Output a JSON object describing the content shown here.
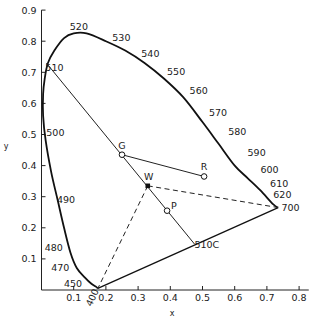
{
  "chart_data": {
    "type": "scatter",
    "title": "",
    "xlabel": "x",
    "ylabel": "y",
    "xlim": [
      0,
      0.83
    ],
    "ylim": [
      0,
      0.9
    ],
    "grid": false,
    "x_ticks": [
      "0.1",
      "0.2",
      "0.3",
      "0.4",
      "0.5",
      "0.6",
      "0.7",
      "0.8"
    ],
    "y_ticks": [
      "0.1",
      "0.2",
      "0.3",
      "0.4",
      "0.5",
      "0.6",
      "0.7",
      "0.8",
      "0.9"
    ],
    "spectral_locus": {
      "name": "Spectral locus",
      "points": [
        [
          0.175,
          0.005
        ],
        [
          0.17,
          0.01
        ],
        [
          0.155,
          0.02
        ],
        [
          0.135,
          0.04
        ],
        [
          0.11,
          0.07
        ],
        [
          0.09,
          0.12
        ],
        [
          0.07,
          0.2
        ],
        [
          0.05,
          0.29
        ],
        [
          0.03,
          0.38
        ],
        [
          0.013,
          0.48
        ],
        [
          0.005,
          0.56
        ],
        [
          0.005,
          0.63
        ],
        [
          0.01,
          0.68
        ],
        [
          0.02,
          0.73
        ],
        [
          0.04,
          0.77
        ],
        [
          0.07,
          0.81
        ],
        [
          0.1,
          0.825
        ],
        [
          0.14,
          0.825
        ],
        [
          0.2,
          0.8
        ],
        [
          0.26,
          0.77
        ],
        [
          0.32,
          0.73
        ],
        [
          0.38,
          0.68
        ],
        [
          0.44,
          0.62
        ],
        [
          0.5,
          0.54
        ],
        [
          0.55,
          0.47
        ],
        [
          0.6,
          0.4
        ],
        [
          0.64,
          0.36
        ],
        [
          0.68,
          0.32
        ],
        [
          0.72,
          0.275
        ],
        [
          0.735,
          0.265
        ]
      ]
    },
    "purple_line": {
      "from": [
        0.175,
        0.005
      ],
      "to": [
        0.735,
        0.265
      ]
    },
    "wavelength_labels": [
      {
        "text": "520",
        "x": 0.088,
        "y": 0.835
      },
      {
        "text": "530",
        "x": 0.22,
        "y": 0.8
      },
      {
        "text": "540",
        "x": 0.31,
        "y": 0.75
      },
      {
        "text": "550",
        "x": 0.39,
        "y": 0.69
      },
      {
        "text": "560",
        "x": 0.46,
        "y": 0.63
      },
      {
        "text": "570",
        "x": 0.52,
        "y": 0.56
      },
      {
        "text": "580",
        "x": 0.58,
        "y": 0.5
      },
      {
        "text": "590",
        "x": 0.64,
        "y": 0.43
      },
      {
        "text": "600",
        "x": 0.68,
        "y": 0.375
      },
      {
        "text": "610",
        "x": 0.71,
        "y": 0.33
      },
      {
        "text": "620",
        "x": 0.72,
        "y": 0.295
      },
      {
        "text": "700",
        "x": 0.745,
        "y": 0.255
      },
      {
        "text": "510",
        "x": 0.012,
        "y": 0.705
      },
      {
        "text": "500",
        "x": 0.015,
        "y": 0.495
      },
      {
        "text": "490",
        "x": 0.048,
        "y": 0.28
      },
      {
        "text": "480",
        "x": 0.01,
        "y": 0.125
      },
      {
        "text": "470",
        "x": 0.03,
        "y": 0.06
      },
      {
        "text": "450",
        "x": 0.07,
        "y": 0.01
      },
      {
        "text": "400",
        "x": 0.155,
        "y": -0.055,
        "rotate": -65
      },
      {
        "text": "510C",
        "x": 0.475,
        "y": 0.135
      }
    ],
    "points": [
      {
        "label": "W",
        "x": 0.33,
        "y": 0.335,
        "marker": "filled-square"
      },
      {
        "label": "G",
        "x": 0.25,
        "y": 0.435,
        "marker": "open-circle"
      },
      {
        "label": "R",
        "x": 0.505,
        "y": 0.365,
        "marker": "open-circle"
      },
      {
        "label": "P",
        "x": 0.39,
        "y": 0.255,
        "marker": "open-circle"
      }
    ],
    "lines": [
      {
        "name": "510-to-510C",
        "from": [
          0.015,
          0.73
        ],
        "to": [
          0.475,
          0.148
        ],
        "style": "solid"
      },
      {
        "name": "G-to-R",
        "from": [
          0.25,
          0.435
        ],
        "to": [
          0.505,
          0.365
        ],
        "style": "solid"
      },
      {
        "name": "W-to-400",
        "from": [
          0.33,
          0.335
        ],
        "to": [
          0.175,
          0.005
        ],
        "style": "dashed"
      },
      {
        "name": "W-to-700",
        "from": [
          0.33,
          0.335
        ],
        "to": [
          0.735,
          0.265
        ],
        "style": "dashed"
      }
    ]
  }
}
